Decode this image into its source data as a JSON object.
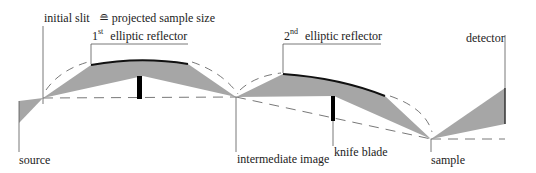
{
  "labels": {
    "initial_slit": "initial slit",
    "equiv_symbol": "≘",
    "projected_sample_size": "projected sample size",
    "first_reflector_num": "1",
    "first_reflector_sup": "st",
    "first_reflector": "elliptic reflector",
    "second_reflector_num": "2",
    "second_reflector_sup": "nd",
    "second_reflector": "elliptic reflector",
    "detector": "detector",
    "source": "source",
    "intermediate_image": "intermediate image",
    "knife_blade": "knife blade",
    "sample": "sample"
  },
  "colors": {
    "beam_fill": "#a6a6a6",
    "line": "#333333",
    "mirror": "#111111",
    "dashed": "#555555"
  }
}
